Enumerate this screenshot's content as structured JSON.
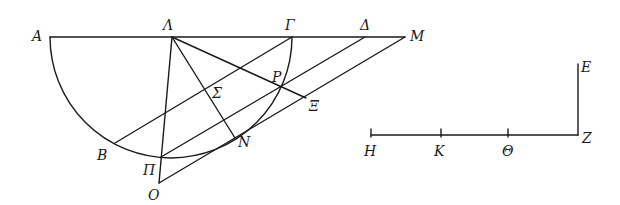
{
  "figure": {
    "labels": {
      "A": "A",
      "Lambda": "Λ",
      "Gamma": "Γ",
      "Delta": "Δ",
      "M": "M",
      "P": "P",
      "Sigma": "Σ",
      "Xi": "Ξ",
      "B": "B",
      "Pi": "Π",
      "N": "N",
      "O": "O",
      "E": "E",
      "Z": "Z",
      "H": "H",
      "K": "K",
      "Theta": "Θ"
    },
    "points": {
      "A": [
        50,
        37
      ],
      "Lambda": [
        172,
        37
      ],
      "Gamma": [
        292,
        37
      ],
      "Delta": [
        365,
        37
      ],
      "M": [
        405,
        37
      ],
      "P": [
        282,
        87
      ],
      "Sigma": [
        219,
        102
      ],
      "Xi": [
        306,
        98
      ],
      "B": [
        115,
        143
      ],
      "Pi": [
        161,
        157
      ],
      "N": [
        235,
        138
      ],
      "O": [
        159,
        183
      ],
      "E": [
        578,
        64
      ],
      "Z": [
        578,
        135
      ],
      "H": [
        371,
        135
      ],
      "K": [
        441,
        135
      ],
      "Theta": [
        508,
        135
      ]
    },
    "stroke_color": "#1a1a1a",
    "background": "#ffffff"
  }
}
